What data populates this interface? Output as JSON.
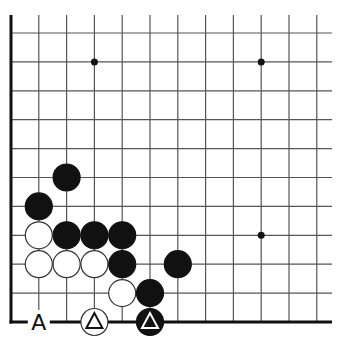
{
  "diagram": {
    "type": "go-board-corner",
    "grid": {
      "columns": 12,
      "rows": 11,
      "origin_x": 11,
      "origin_y": 33,
      "col_spacing": 27.8,
      "row_spacing": 28.9,
      "left_edge": true,
      "bottom_edge": true
    },
    "star_points": [
      {
        "col": 3,
        "row": 1
      },
      {
        "col": 9,
        "row": 1
      },
      {
        "col": 9,
        "row": 7
      }
    ],
    "stones": [
      {
        "color": "black",
        "col": 2,
        "row": 5
      },
      {
        "color": "black",
        "col": 1,
        "row": 6
      },
      {
        "color": "white",
        "col": 1,
        "row": 7
      },
      {
        "color": "black",
        "col": 2,
        "row": 7
      },
      {
        "color": "black",
        "col": 3,
        "row": 7
      },
      {
        "color": "black",
        "col": 4,
        "row": 7
      },
      {
        "color": "white",
        "col": 1,
        "row": 8
      },
      {
        "color": "white",
        "col": 2,
        "row": 8
      },
      {
        "color": "white",
        "col": 3,
        "row": 8
      },
      {
        "color": "black",
        "col": 4,
        "row": 8
      },
      {
        "color": "black",
        "col": 6,
        "row": 8
      },
      {
        "color": "white",
        "col": 4,
        "row": 9
      },
      {
        "color": "black",
        "col": 5,
        "row": 9
      },
      {
        "color": "white",
        "col": 3,
        "row": 10,
        "marker": "triangle"
      },
      {
        "color": "black",
        "col": 5,
        "row": 10,
        "marker": "triangle"
      }
    ],
    "labels": [
      {
        "text": "A",
        "col": 1,
        "row": 10
      }
    ],
    "colors": {
      "line": "#555555",
      "edge": "#111111",
      "black_stone": "#111111",
      "white_stone": "#ffffff",
      "stone_outline": "#333333"
    }
  }
}
